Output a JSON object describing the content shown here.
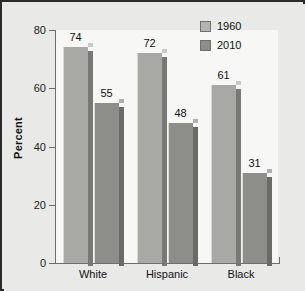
{
  "chart_data": {
    "type": "bar",
    "title": "",
    "xlabel": "",
    "ylabel": "Percent",
    "ylim": [
      0,
      80
    ],
    "yticks": [
      0,
      20,
      40,
      60,
      80
    ],
    "ytick_labels": [
      "0",
      "20",
      "40",
      "60",
      "80"
    ],
    "grid": false,
    "legend_position": "top-right",
    "categories": [
      "White",
      "Hispanic",
      "Black"
    ],
    "series": [
      {
        "name": "1960",
        "color": "#a8a8a5",
        "values": [
          74,
          72,
          61
        ],
        "value_labels": [
          "74",
          "72",
          "61"
        ]
      },
      {
        "name": "2010",
        "color": "#8d8d8a",
        "values": [
          55,
          48,
          31
        ],
        "value_labels": [
          "55",
          "48",
          "31"
        ]
      }
    ]
  },
  "legend": {
    "entries": [
      {
        "label": "1960"
      },
      {
        "label": "2010"
      }
    ]
  },
  "colors": {
    "frame_border": "#2b2b2b",
    "figure_background": "#e9e9e7",
    "plot_background": "#f7f7f5",
    "axis": "#6e6e6e",
    "series_1960": "#a8a8a5",
    "series_2010": "#8d8d8a",
    "text": "#111111"
  }
}
